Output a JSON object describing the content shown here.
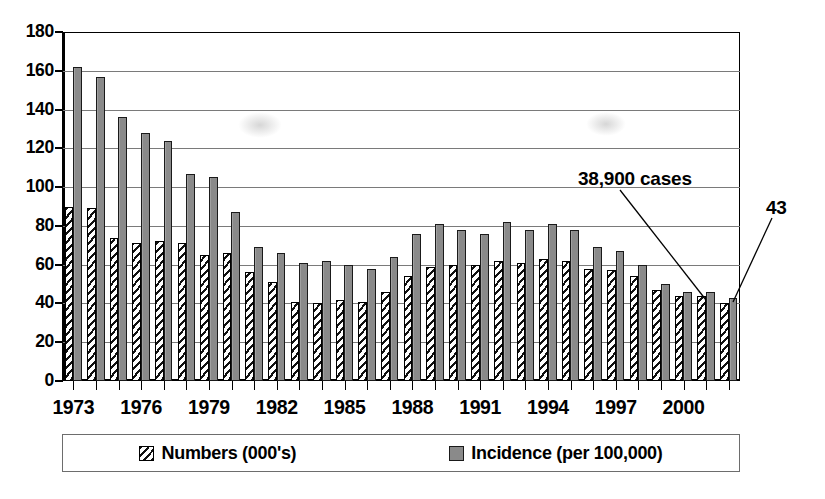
{
  "chart_data": {
    "type": "bar",
    "title": "",
    "xlabel": "",
    "ylabel": "",
    "ylim": [
      0,
      180
    ],
    "ytick_step": 20,
    "yticks": [
      0,
      20,
      40,
      60,
      80,
      100,
      120,
      140,
      160,
      180
    ],
    "grid": true,
    "legend_position": "bottom",
    "categories": [
      1973,
      1974,
      1975,
      1976,
      1977,
      1978,
      1979,
      1980,
      1981,
      1982,
      1983,
      1984,
      1985,
      1986,
      1987,
      1988,
      1989,
      1990,
      1991,
      1992,
      1993,
      1994,
      1995,
      1996,
      1997,
      1998,
      1999,
      2000,
      2001,
      2002
    ],
    "xtick_labels": [
      "1973",
      "1976",
      "1979",
      "1982",
      "1985",
      "1988",
      "1991",
      "1994",
      "1997",
      "2000"
    ],
    "xtick_label_years": [
      1973,
      1976,
      1979,
      1982,
      1985,
      1988,
      1991,
      1994,
      1997,
      2000
    ],
    "series": [
      {
        "name": "Numbers (000's)",
        "pattern": "diagonal-hatch",
        "values": [
          90,
          89,
          74,
          71,
          72,
          71,
          65,
          66,
          56,
          51,
          41,
          40,
          42,
          41,
          46,
          54,
          59,
          60,
          60,
          62,
          61,
          63,
          62,
          58,
          57,
          54,
          47,
          44,
          44,
          40
        ]
      },
      {
        "name": "Incidence (per 100,000)",
        "pattern": "solid-gray",
        "values": [
          162,
          157,
          136,
          128,
          124,
          107,
          105,
          87,
          69,
          66,
          61,
          62,
          60,
          58,
          64,
          76,
          81,
          78,
          76,
          82,
          78,
          81,
          78,
          69,
          67,
          60,
          50,
          46,
          46,
          43
        ]
      }
    ],
    "annotations": [
      {
        "text": "38,900 cases",
        "points_to_year": 2001,
        "points_to_series": "Numbers (000's)"
      },
      {
        "text": "43",
        "points_to_year": 2002,
        "points_to_series": "Incidence (per 100,000)"
      }
    ]
  },
  "legend": {
    "items": [
      {
        "label": "Numbers (000's)",
        "swatch": "hatched-swatch"
      },
      {
        "label": "Incidence (per 100,000)",
        "swatch": "gray-swatch"
      }
    ]
  }
}
